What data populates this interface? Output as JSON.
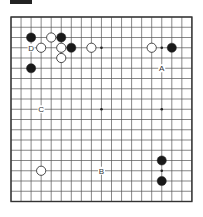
{
  "board": {
    "size": 19,
    "origin_x": 11,
    "origin_y": 17,
    "spacing_x": 10.05,
    "spacing_y": 10.25,
    "line_color": "#555555",
    "border_color": "#333333",
    "hoshi": [
      [
        3,
        3
      ],
      [
        9,
        3
      ],
      [
        15,
        3
      ],
      [
        3,
        9
      ],
      [
        9,
        9
      ],
      [
        15,
        9
      ],
      [
        3,
        15
      ],
      [
        9,
        15
      ],
      [
        15,
        15
      ]
    ]
  },
  "stones": [
    {
      "color": "black",
      "col": 2,
      "row": 2
    },
    {
      "color": "white",
      "col": 4,
      "row": 2
    },
    {
      "color": "black",
      "col": 5,
      "row": 2
    },
    {
      "color": "white",
      "col": 3,
      "row": 3
    },
    {
      "color": "white",
      "col": 5,
      "row": 3
    },
    {
      "color": "black",
      "col": 6,
      "row": 3
    },
    {
      "color": "white",
      "col": 8,
      "row": 3
    },
    {
      "color": "white",
      "col": 5,
      "row": 4
    },
    {
      "color": "black",
      "col": 2,
      "row": 5
    },
    {
      "color": "white",
      "col": 14,
      "row": 3
    },
    {
      "color": "black",
      "col": 16,
      "row": 3
    },
    {
      "color": "black",
      "col": 15,
      "row": 14
    },
    {
      "color": "black",
      "col": 15,
      "row": 16
    },
    {
      "color": "white",
      "col": 3,
      "row": 15
    }
  ],
  "labels": [
    {
      "text": "D",
      "col": 2,
      "row": 3
    },
    {
      "text": "A",
      "col": 15,
      "row": 5
    },
    {
      "text": "C",
      "col": 3,
      "row": 9
    },
    {
      "text": "B",
      "col": 9,
      "row": 15
    }
  ]
}
